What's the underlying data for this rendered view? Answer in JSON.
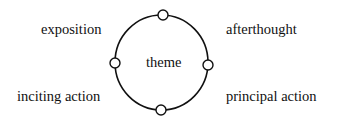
{
  "diagram": {
    "center_label": "theme",
    "labels": {
      "top_left": "exposition",
      "top_right": "afterthought",
      "bottom_left": "inciting action",
      "bottom_right": "principal action"
    },
    "nodes": [
      "top",
      "right",
      "bottom",
      "left"
    ],
    "colors": {
      "stroke": "#111111",
      "fill": "#ffffff"
    }
  }
}
